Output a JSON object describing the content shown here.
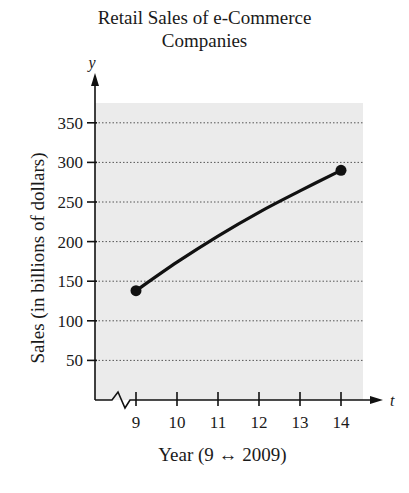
{
  "chart_data": {
    "type": "line",
    "title": "Retail Sales of e-Commerce Companies",
    "title_lines": [
      "Retail Sales of e-Commerce",
      "Companies"
    ],
    "xlabel": "Year (9 ↔ 2009)",
    "ylabel": "Sales (in billions of dollars)",
    "x_axis_var": "t",
    "y_axis_var": "y",
    "x_ticks": [
      9,
      10,
      11,
      12,
      13,
      14
    ],
    "y_ticks": [
      50,
      100,
      150,
      200,
      250,
      300,
      350
    ],
    "xlim": [
      8,
      15
    ],
    "ylim": [
      0,
      375
    ],
    "x_axis_break": true,
    "grid": "horizontal dotted",
    "series": [
      {
        "name": "Retail sales",
        "x": [
          9,
          10,
          11,
          12,
          13,
          14
        ],
        "y": [
          138,
          174,
          207,
          237,
          264,
          290
        ],
        "endpoints_marked": true
      }
    ],
    "background": "#ebebeb",
    "line_color": "#111111"
  }
}
